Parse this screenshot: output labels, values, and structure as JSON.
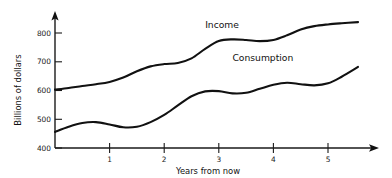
{
  "chart_data": {
    "type": "line",
    "title": "",
    "subtitle": "",
    "xlabel": "Years from now",
    "ylabel": "Billions of dollars",
    "xlim": [
      0,
      5.55
    ],
    "ylim": [
      400,
      860
    ],
    "grid": false,
    "legend_position": "inline-annotations",
    "x_ticks": [
      1,
      2,
      3,
      4,
      5
    ],
    "x_tick_labels": [
      "1",
      "2",
      "3",
      "4",
      "5"
    ],
    "y_ticks": [
      400,
      500,
      600,
      700,
      800
    ],
    "y_tick_labels": [
      "400",
      "500",
      "600",
      "700",
      "800"
    ],
    "x": [
      0,
      0.25,
      0.5,
      0.75,
      1,
      1.25,
      1.5,
      1.75,
      2,
      2.25,
      2.5,
      2.75,
      3,
      3.25,
      3.5,
      3.75,
      4,
      4.25,
      4.5,
      4.75,
      5,
      5.25,
      5.55
    ],
    "series": [
      {
        "name": "Income",
        "label": "Income",
        "color": "#111111",
        "values": [
          603,
          609,
          616,
          622,
          630,
          645,
          667,
          684,
          692,
          696,
          712,
          745,
          772,
          778,
          776,
          772,
          776,
          792,
          812,
          824,
          830,
          834,
          838
        ]
      },
      {
        "name": "Consumption",
        "label": "Consumption",
        "color": "#111111",
        "values": [
          456,
          474,
          487,
          490,
          482,
          472,
          474,
          490,
          515,
          548,
          580,
          597,
          598,
          590,
          592,
          606,
          620,
          627,
          622,
          618,
          625,
          648,
          682
        ]
      }
    ],
    "annotations": [
      {
        "text": "Income",
        "x": 2.75,
        "y": 818,
        "name": "income-series-label"
      },
      {
        "text": "Consumption",
        "x": 3.25,
        "y": 702,
        "name": "consumption-series-label"
      }
    ],
    "axis": {
      "x_arrow": true,
      "y_arrow": true,
      "origin_x": 0,
      "origin_y": 400
    }
  }
}
